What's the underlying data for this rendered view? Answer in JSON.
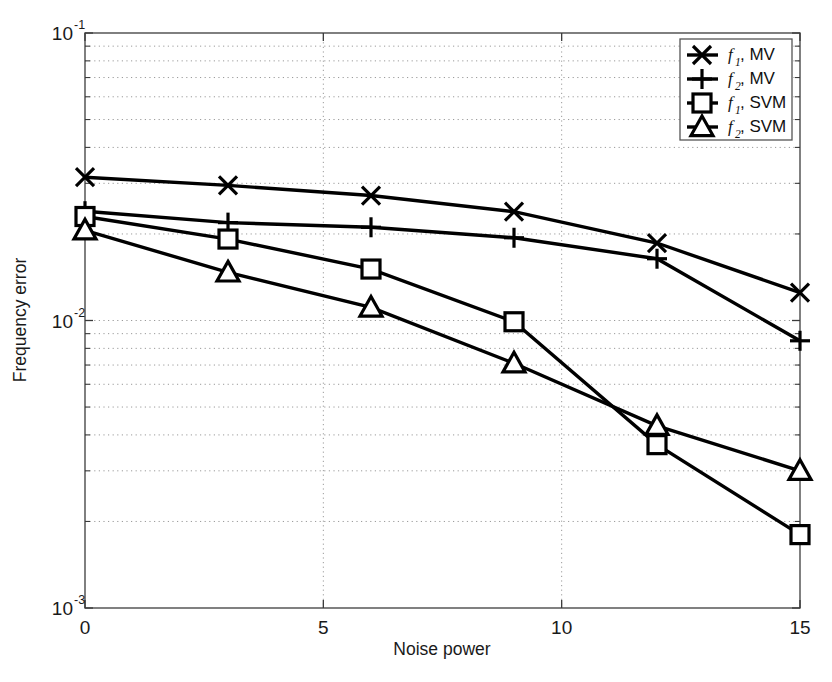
{
  "chart_data": {
    "type": "line",
    "title": "",
    "xlabel": "Noise power",
    "ylabel": "Frequency error",
    "xlim": [
      0,
      15
    ],
    "ylim": [
      0.001,
      0.1
    ],
    "yscale": "log",
    "grid": true,
    "legend_position": "top-right",
    "x": [
      0,
      3,
      6,
      9,
      12,
      15
    ],
    "xticks": [
      "0",
      "5",
      "10",
      "15"
    ],
    "xtick_values": [
      0,
      5,
      10,
      15
    ],
    "ytick_labels": [
      "10",
      "10",
      "10"
    ],
    "ytick_exponents": [
      "-1",
      "-2",
      "-3"
    ],
    "ytick_values": [
      0.1,
      0.01,
      0.001
    ],
    "series": [
      {
        "name": "f1, MV",
        "label_base": "f",
        "label_sub": "1",
        "label_rest": ", MV",
        "marker": "x-cross",
        "values": [
          0.0315,
          0.0295,
          0.0272,
          0.0239,
          0.0186,
          0.0125
        ]
      },
      {
        "name": "f2, MV",
        "label_base": "f",
        "label_sub": "2",
        "label_rest": ", MV",
        "marker": "plus",
        "values": [
          0.024,
          0.0219,
          0.0211,
          0.0194,
          0.0164,
          0.0085
        ]
      },
      {
        "name": "f1, SVM",
        "label_base": "f",
        "label_sub": "1",
        "label_rest": ", SVM",
        "marker": "square",
        "values": [
          0.023,
          0.0192,
          0.0151,
          0.0099,
          0.0037,
          0.0018
        ]
      },
      {
        "name": "f2, SVM",
        "label_base": "f",
        "label_sub": "2",
        "label_rest": ", SVM",
        "marker": "triangle",
        "values": [
          0.0206,
          0.0147,
          0.0111,
          0.0071,
          0.0043,
          0.003
        ]
      }
    ]
  }
}
